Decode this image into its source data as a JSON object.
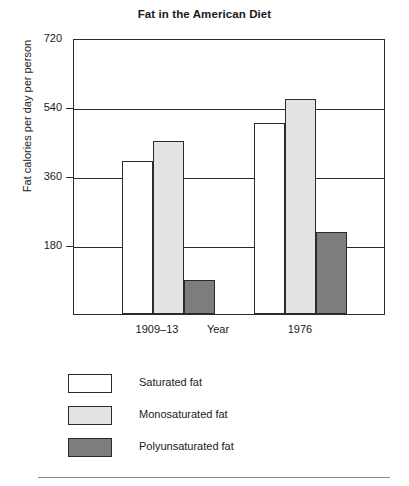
{
  "chart_data": {
    "type": "bar",
    "title": "Fat in the American Diet",
    "xlabel": "Year",
    "ylabel": "Fat calories per day per person",
    "categories": [
      "1909–13",
      "1976"
    ],
    "series": [
      {
        "name": "Saturated fat",
        "values": [
          400,
          497
        ],
        "color": "#ffffff"
      },
      {
        "name": "Monosaturated fat",
        "values": [
          452,
          561
        ],
        "color": "#e3e3e3"
      },
      {
        "name": "Polyunsaturated fat",
        "values": [
          88,
          213
        ],
        "color": "#7d7d7d"
      }
    ],
    "ylim": [
      0,
      720
    ],
    "yticks": [
      180,
      360,
      540,
      720
    ],
    "ytick_labels": [
      "180",
      "360",
      "540",
      "720"
    ],
    "grid": true,
    "legend_position": "below"
  },
  "legend": {
    "items": [
      {
        "label": "Saturated fat"
      },
      {
        "label": "Monosaturated fat"
      },
      {
        "label": "Polyunsaturated fat"
      }
    ]
  }
}
